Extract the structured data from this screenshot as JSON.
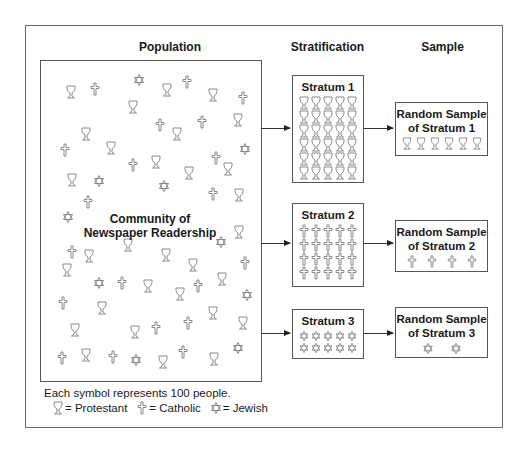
{
  "headers": {
    "population": "Population",
    "stratification": "Stratification",
    "sample": "Sample"
  },
  "population": {
    "label_line1": "Community of",
    "label_line2": "Newspaper Readership",
    "symbols": [
      {
        "type": "goblet",
        "x": 71,
        "y": 92
      },
      {
        "type": "cross",
        "x": 95,
        "y": 89
      },
      {
        "type": "star",
        "x": 139,
        "y": 80
      },
      {
        "type": "goblet",
        "x": 167,
        "y": 90
      },
      {
        "type": "cross",
        "x": 187,
        "y": 82
      },
      {
        "type": "goblet",
        "x": 213,
        "y": 95
      },
      {
        "type": "cross",
        "x": 243,
        "y": 98
      },
      {
        "type": "goblet",
        "x": 133,
        "y": 107
      },
      {
        "type": "cross",
        "x": 160,
        "y": 125
      },
      {
        "type": "cross",
        "x": 202,
        "y": 122
      },
      {
        "type": "goblet",
        "x": 238,
        "y": 120
      },
      {
        "type": "goblet",
        "x": 86,
        "y": 134
      },
      {
        "type": "goblet",
        "x": 177,
        "y": 134
      },
      {
        "type": "cross",
        "x": 65,
        "y": 150
      },
      {
        "type": "goblet",
        "x": 111,
        "y": 148
      },
      {
        "type": "star",
        "x": 245,
        "y": 149
      },
      {
        "type": "cross",
        "x": 133,
        "y": 165
      },
      {
        "type": "goblet",
        "x": 156,
        "y": 162
      },
      {
        "type": "cross",
        "x": 216,
        "y": 158
      },
      {
        "type": "goblet",
        "x": 228,
        "y": 169
      },
      {
        "type": "goblet",
        "x": 189,
        "y": 173
      },
      {
        "type": "goblet",
        "x": 72,
        "y": 180
      },
      {
        "type": "star",
        "x": 99,
        "y": 181
      },
      {
        "type": "star",
        "x": 164,
        "y": 186
      },
      {
        "type": "cross",
        "x": 213,
        "y": 194
      },
      {
        "type": "goblet",
        "x": 239,
        "y": 195
      },
      {
        "type": "cross",
        "x": 88,
        "y": 202
      },
      {
        "type": "star",
        "x": 68,
        "y": 217
      },
      {
        "type": "goblet",
        "x": 239,
        "y": 232
      },
      {
        "type": "star",
        "x": 221,
        "y": 242
      },
      {
        "type": "cross",
        "x": 72,
        "y": 252
      },
      {
        "type": "goblet",
        "x": 89,
        "y": 256
      },
      {
        "type": "goblet",
        "x": 128,
        "y": 245
      },
      {
        "type": "goblet",
        "x": 166,
        "y": 255
      },
      {
        "type": "goblet",
        "x": 193,
        "y": 265
      },
      {
        "type": "cross",
        "x": 245,
        "y": 263
      },
      {
        "type": "goblet",
        "x": 67,
        "y": 270
      },
      {
        "type": "star",
        "x": 99,
        "y": 283
      },
      {
        "type": "cross",
        "x": 122,
        "y": 283
      },
      {
        "type": "goblet",
        "x": 148,
        "y": 286
      },
      {
        "type": "goblet",
        "x": 222,
        "y": 279
      },
      {
        "type": "cross",
        "x": 198,
        "y": 286
      },
      {
        "type": "goblet",
        "x": 180,
        "y": 294
      },
      {
        "type": "star",
        "x": 247,
        "y": 295
      },
      {
        "type": "cross",
        "x": 63,
        "y": 303
      },
      {
        "type": "goblet",
        "x": 102,
        "y": 308
      },
      {
        "type": "goblet",
        "x": 213,
        "y": 313
      },
      {
        "type": "cross",
        "x": 188,
        "y": 323
      },
      {
        "type": "goblet",
        "x": 243,
        "y": 323
      },
      {
        "type": "goblet",
        "x": 75,
        "y": 330
      },
      {
        "type": "goblet",
        "x": 135,
        "y": 332
      },
      {
        "type": "cross",
        "x": 156,
        "y": 328
      },
      {
        "type": "cross",
        "x": 62,
        "y": 358
      },
      {
        "type": "goblet",
        "x": 86,
        "y": 355
      },
      {
        "type": "cross",
        "x": 113,
        "y": 357
      },
      {
        "type": "star",
        "x": 136,
        "y": 360
      },
      {
        "type": "goblet",
        "x": 163,
        "y": 362
      },
      {
        "type": "cross",
        "x": 183,
        "y": 352
      },
      {
        "type": "star",
        "x": 238,
        "y": 348
      },
      {
        "type": "goblet",
        "x": 214,
        "y": 359
      }
    ]
  },
  "strata": [
    {
      "title": "Stratum 1",
      "symbol": "goblet",
      "columns": 5,
      "count": 30,
      "sample_line1": "Random Sample",
      "sample_line2": "of Stratum 1",
      "sample_count": 6
    },
    {
      "title": "Stratum 2",
      "symbol": "cross",
      "columns": 5,
      "count": 20,
      "sample_line1": "Random Sample",
      "sample_line2": "of Stratum 2",
      "sample_count": 4
    },
    {
      "title": "Stratum 3",
      "symbol": "star",
      "columns": 5,
      "count": 10,
      "sample_line1": "Random Sample",
      "sample_line2": "of Stratum 3",
      "sample_count": 2
    }
  ],
  "caption": "Each symbol represents 100 people.",
  "legend": [
    {
      "symbol": "goblet",
      "label": "= Protestant"
    },
    {
      "symbol": "cross",
      "label": "= Catholic"
    },
    {
      "symbol": "star",
      "label": "= Jewish"
    }
  ],
  "colors": {
    "symbol_stroke": "#8a8a8a",
    "border": "#555555",
    "text": "#1a1a1a"
  }
}
